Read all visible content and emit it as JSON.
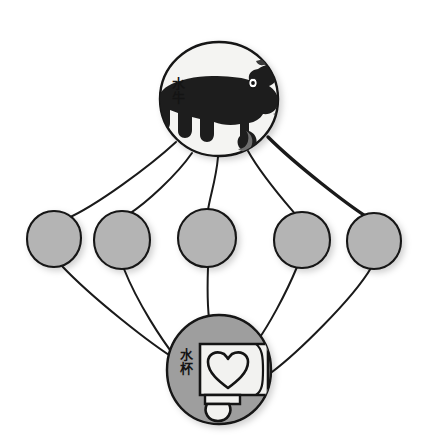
{
  "diagram": {
    "type": "concept-network-graph",
    "background_color": "#ffffff",
    "ink_color": "#1a1a1a",
    "node_fill_gray": "#b4b4b4",
    "node_fill_light": "#f4f4f2",
    "top_node": {
      "id": "node-water-buffalo",
      "label": "水牛",
      "label_meaning": "water buffalo",
      "icon": "water-buffalo-icon",
      "fill": "#f4f4f2",
      "cx": 219,
      "cy": 99,
      "rx": 59,
      "ry": 57
    },
    "bottom_node": {
      "id": "node-water-cup",
      "label": "水杯",
      "label_meaning": "water cup",
      "icon": "water-cup-icon",
      "fill": "#9e9e9e",
      "cx": 219,
      "cy": 370,
      "rx": 52,
      "ry": 55
    },
    "middle_nodes": [
      {
        "id": "node-middle-1",
        "label": "",
        "fill": "#b4b4b4",
        "cx": 54,
        "cy": 239,
        "rx": 27,
        "ry": 28
      },
      {
        "id": "node-middle-2",
        "label": "",
        "fill": "#b4b4b4",
        "cx": 122,
        "cy": 240,
        "rx": 28,
        "ry": 29
      },
      {
        "id": "node-middle-3",
        "label": "",
        "fill": "#b4b4b4",
        "cx": 207,
        "cy": 238,
        "rx": 29,
        "ry": 29
      },
      {
        "id": "node-middle-4",
        "label": "",
        "fill": "#b4b4b4",
        "cx": 302,
        "cy": 240,
        "rx": 28,
        "ry": 28
      },
      {
        "id": "node-middle-5",
        "label": "",
        "fill": "#b4b4b4",
        "cx": 374,
        "cy": 241,
        "rx": 27,
        "ry": 28
      }
    ],
    "edges_from_top": [
      {
        "from": "node-water-buffalo",
        "to": "node-middle-1",
        "stroke_width": 2.0
      },
      {
        "from": "node-water-buffalo",
        "to": "node-middle-2",
        "stroke_width": 2.0
      },
      {
        "from": "node-water-buffalo",
        "to": "node-middle-3",
        "stroke_width": 2.0
      },
      {
        "from": "node-water-buffalo",
        "to": "node-middle-4",
        "stroke_width": 2.0
      },
      {
        "from": "node-water-buffalo",
        "to": "node-middle-5",
        "stroke_width": 3.4
      }
    ],
    "edges_to_bottom": [
      {
        "from": "node-middle-1",
        "to": "node-water-cup",
        "stroke_width": 2.0
      },
      {
        "from": "node-middle-2",
        "to": "node-water-cup",
        "stroke_width": 2.0
      },
      {
        "from": "node-middle-3",
        "to": "node-water-cup",
        "stroke_width": 2.0
      },
      {
        "from": "node-middle-4",
        "to": "node-water-cup",
        "stroke_width": 2.0
      },
      {
        "from": "node-middle-5",
        "to": "node-water-cup",
        "stroke_width": 2.0
      }
    ]
  }
}
